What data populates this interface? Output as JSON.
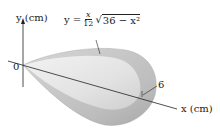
{
  "figure": {
    "type": "solid-of-revolution",
    "y_axis_label": "y (cm)",
    "x_axis_label": "x (cm)",
    "origin_label": "0",
    "radius_marker_label": "6",
    "equation": {
      "lhs": "y =",
      "frac_num": "x",
      "frac_den": "12",
      "radical_sign": "√",
      "radicand": "36 − x²"
    }
  },
  "colors": {
    "outer_surface": "#c8c8c8",
    "inner_surface": "#e4e4e4",
    "axis": "#222222"
  }
}
